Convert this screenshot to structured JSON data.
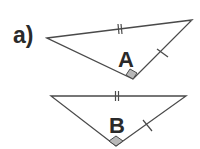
{
  "part_label": "a)",
  "triangles": [
    {
      "name": "A",
      "vertices": [
        [
          47,
          38
        ],
        [
          192,
          20
        ],
        [
          133,
          79
        ]
      ],
      "right_angle_at": "bottom",
      "marks": {
        "long_side": "double-tick",
        "short_side": "single-tick"
      }
    },
    {
      "name": "B",
      "vertices": [
        [
          51,
          96
        ],
        [
          186,
          96
        ],
        [
          116,
          146
        ]
      ],
      "right_angle_at": "bottom",
      "marks": {
        "long_side": "double-tick",
        "short_side": "single-tick"
      }
    }
  ],
  "colors": {
    "line": "#4a4a4a",
    "text": "#2a2a2a",
    "right_angle_fill": "#b8b8b8",
    "background": "#ffffff"
  }
}
